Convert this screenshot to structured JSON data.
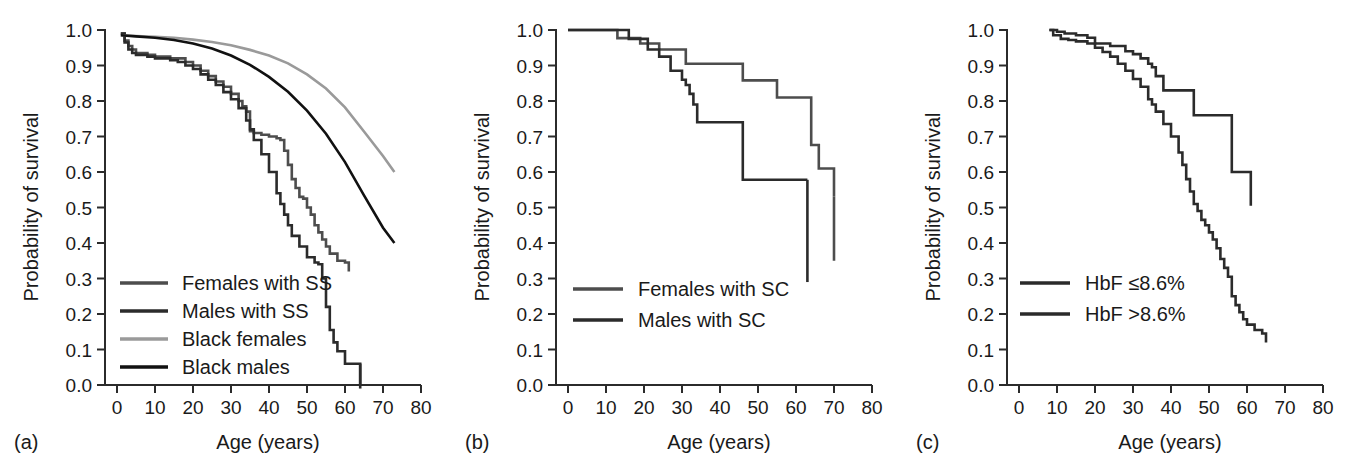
{
  "figure": {
    "background": "#ffffff",
    "panel_count": 3
  },
  "axes": {
    "ylabel": "Probability of survival",
    "xlabel": "Age (years)",
    "yticks": [
      "0.0",
      "0.1",
      "0.2",
      "0.3",
      "0.4",
      "0.5",
      "0.6",
      "0.7",
      "0.8",
      "0.9",
      "1.0"
    ],
    "xticks": [
      "0",
      "10",
      "20",
      "30",
      "40",
      "50",
      "60",
      "70",
      "80"
    ],
    "ylim": [
      0.0,
      1.0
    ],
    "xlim": [
      0,
      80
    ]
  },
  "panels": [
    {
      "id": "a",
      "label": "(a)",
      "legend": [
        {
          "label": "Females with SS",
          "color": "#4d4d4d"
        },
        {
          "label": "Males with SS",
          "color": "#2b2b2b"
        },
        {
          "label": "Black females",
          "color": "#9a9a9a"
        },
        {
          "label": "Black males",
          "color": "#111111"
        }
      ]
    },
    {
      "id": "b",
      "label": "(b)",
      "legend": [
        {
          "label": "Females with SC",
          "color": "#4d4d4d"
        },
        {
          "label": "Males with SC",
          "color": "#2b2b2b"
        }
      ]
    },
    {
      "id": "c",
      "label": "(c)",
      "legend": [
        {
          "label": "HbF ≤8.6%",
          "color": "#2b2b2b"
        },
        {
          "label": "HbF >8.6%",
          "color": "#2b2b2b"
        }
      ]
    }
  ],
  "chart_data": [
    {
      "type": "line",
      "title": "(a)",
      "xlabel": "Age (years)",
      "ylabel": "Probability of survival",
      "xlim": [
        0,
        80
      ],
      "ylim": [
        0.0,
        1.0
      ],
      "grid": false,
      "legend_position": "inside-lower-left",
      "series": [
        {
          "name": "Females with SS",
          "color": "#4d4d4d",
          "step": true,
          "x": [
            1,
            2,
            3,
            4,
            5,
            6,
            8,
            10,
            12,
            14,
            15,
            16,
            18,
            20,
            22,
            24,
            26,
            28,
            30,
            32,
            33,
            34,
            35,
            36,
            38,
            40,
            42,
            43,
            44,
            45,
            46,
            47,
            48,
            49,
            50,
            51,
            52,
            53,
            54,
            55,
            56,
            58,
            60,
            61
          ],
          "y": [
            0.99,
            0.97,
            0.955,
            0.945,
            0.935,
            0.935,
            0.93,
            0.925,
            0.925,
            0.92,
            0.92,
            0.92,
            0.91,
            0.9,
            0.885,
            0.87,
            0.855,
            0.84,
            0.82,
            0.8,
            0.785,
            0.77,
            0.715,
            0.71,
            0.705,
            0.7,
            0.695,
            0.69,
            0.66,
            0.62,
            0.58,
            0.555,
            0.53,
            0.525,
            0.5,
            0.48,
            0.45,
            0.43,
            0.41,
            0.39,
            0.37,
            0.35,
            0.345,
            0.32
          ]
        },
        {
          "name": "Males with SS",
          "color": "#2b2b2b",
          "step": true,
          "x": [
            1,
            2,
            3,
            4,
            5,
            6,
            8,
            10,
            12,
            14,
            16,
            18,
            20,
            22,
            24,
            26,
            28,
            30,
            32,
            34,
            35,
            36,
            38,
            40,
            42,
            43,
            44,
            45,
            46,
            48,
            50,
            52,
            53,
            54,
            55,
            56,
            57,
            58,
            60,
            62,
            64
          ],
          "y": [
            0.99,
            0.965,
            0.945,
            0.935,
            0.93,
            0.93,
            0.925,
            0.92,
            0.92,
            0.915,
            0.91,
            0.9,
            0.89,
            0.875,
            0.86,
            0.845,
            0.825,
            0.805,
            0.78,
            0.745,
            0.72,
            0.69,
            0.65,
            0.6,
            0.54,
            0.51,
            0.48,
            0.45,
            0.42,
            0.39,
            0.36,
            0.345,
            0.34,
            0.3,
            0.22,
            0.155,
            0.12,
            0.095,
            0.06,
            0.06,
            0.0
          ]
        },
        {
          "name": "Black females",
          "color": "#9a9a9a",
          "step": false,
          "x": [
            1,
            5,
            10,
            15,
            20,
            25,
            30,
            35,
            40,
            45,
            50,
            55,
            60,
            65,
            70,
            73
          ],
          "y": [
            0.985,
            0.983,
            0.981,
            0.978,
            0.973,
            0.966,
            0.957,
            0.944,
            0.928,
            0.906,
            0.875,
            0.835,
            0.782,
            0.714,
            0.645,
            0.6
          ]
        },
        {
          "name": "Black males",
          "color": "#111111",
          "step": false,
          "x": [
            1,
            5,
            10,
            15,
            20,
            25,
            30,
            35,
            40,
            45,
            50,
            55,
            60,
            65,
            70,
            73
          ],
          "y": [
            0.985,
            0.982,
            0.978,
            0.972,
            0.962,
            0.948,
            0.928,
            0.902,
            0.868,
            0.826,
            0.773,
            0.708,
            0.628,
            0.534,
            0.443,
            0.4
          ]
        }
      ]
    },
    {
      "type": "line",
      "title": "(b)",
      "xlabel": "Age (years)",
      "ylabel": "Probability of survival",
      "xlim": [
        0,
        80
      ],
      "ylim": [
        0.0,
        1.0
      ],
      "grid": false,
      "legend_position": "inside-lower-left",
      "series": [
        {
          "name": "Females with SC",
          "color": "#4d4d4d",
          "step": true,
          "x": [
            0,
            12,
            13,
            18,
            19,
            23,
            24,
            30,
            31,
            34,
            45,
            46,
            54,
            55,
            63,
            64,
            65,
            66,
            70
          ],
          "y": [
            1.0,
            1.0,
            0.977,
            0.977,
            0.962,
            0.962,
            0.945,
            0.945,
            0.905,
            0.905,
            0.905,
            0.858,
            0.858,
            0.81,
            0.81,
            0.676,
            0.676,
            0.61,
            0.53
          ]
        },
        {
          "name": "Males with SC",
          "color": "#2b2b2b",
          "step": true,
          "x": [
            0,
            15,
            16,
            20,
            21,
            23,
            24,
            26,
            27,
            29,
            30,
            31,
            32,
            33,
            34,
            45,
            46,
            63
          ],
          "y": [
            1.0,
            1.0,
            0.975,
            0.975,
            0.945,
            0.945,
            0.925,
            0.925,
            0.885,
            0.885,
            0.86,
            0.845,
            0.82,
            0.79,
            0.74,
            0.74,
            0.578,
            0.578
          ]
        }
      ],
      "annotations": [
        {
          "text": "Females with SC curve terminates at age 70 dropping to 0.35"
        },
        {
          "text": "Males with SC curve terminates at age 63 dropping to 0.29"
        }
      ]
    },
    {
      "type": "line",
      "title": "(c)",
      "xlabel": "Age (years)",
      "ylabel": "Probability of survival",
      "xlim": [
        0,
        80
      ],
      "ylim": [
        0.0,
        1.0
      ],
      "grid": false,
      "legend_position": "inside-lower-left",
      "series": [
        {
          "name": "HbF ≤8.6%",
          "color": "#2b2b2b",
          "step": true,
          "x": [
            8,
            9,
            11,
            13,
            15,
            18,
            20,
            22,
            24,
            26,
            28,
            30,
            32,
            34,
            35,
            36,
            38,
            40,
            42,
            43,
            44,
            45,
            46,
            47,
            48,
            49,
            50,
            51,
            52,
            53,
            54,
            55,
            56,
            57,
            58,
            59,
            60,
            62,
            64,
            65
          ],
          "y": [
            1.0,
            0.985,
            0.975,
            0.972,
            0.968,
            0.962,
            0.95,
            0.938,
            0.925,
            0.905,
            0.885,
            0.862,
            0.84,
            0.805,
            0.79,
            0.77,
            0.735,
            0.7,
            0.655,
            0.62,
            0.58,
            0.545,
            0.51,
            0.49,
            0.465,
            0.45,
            0.43,
            0.41,
            0.385,
            0.355,
            0.33,
            0.305,
            0.25,
            0.225,
            0.205,
            0.185,
            0.17,
            0.155,
            0.145,
            0.12
          ]
        },
        {
          "name": "HbF >8.6%",
          "color": "#2b2b2b",
          "step": true,
          "x": [
            8,
            10,
            12,
            15,
            18,
            20,
            24,
            28,
            30,
            32,
            34,
            35,
            36,
            37,
            38,
            45,
            46,
            55,
            56,
            57,
            60,
            61
          ],
          "y": [
            1.0,
            0.995,
            0.99,
            0.985,
            0.978,
            0.962,
            0.955,
            0.94,
            0.932,
            0.92,
            0.905,
            0.895,
            0.87,
            0.87,
            0.83,
            0.83,
            0.76,
            0.76,
            0.6,
            0.6,
            0.6,
            0.505
          ]
        }
      ]
    }
  ]
}
